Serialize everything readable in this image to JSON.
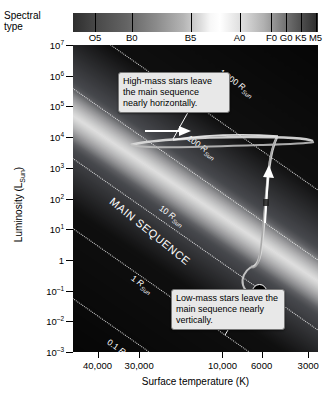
{
  "chart_data": {
    "type": "scatter",
    "xlabel": "Surface temperature (K)",
    "ylabel": "Luminosity (L_Sun)",
    "xlim": [
      40000,
      3000
    ],
    "ylim": [
      0.001,
      10000000
    ],
    "xscale": "log-reversed",
    "yscale": "log",
    "grid": false,
    "legend": "none",
    "x_ticks": [
      "40,000",
      "30,000",
      "10,000",
      "6000",
      "3000"
    ],
    "x_tick_values": [
      40000,
      30000,
      10000,
      6000,
      3000
    ],
    "y_ticks": [
      "10^7",
      "10^6",
      "10^5",
      "10^4",
      "10^3",
      "10^2",
      "10^1",
      "1",
      "10^-1",
      "10^-2",
      "10^-3"
    ],
    "y_tick_values": [
      10000000,
      1000000,
      100000,
      10000,
      1000,
      100,
      10,
      1,
      0.1,
      0.01,
      0.001
    ],
    "spectral_classes": [
      "O5",
      "B0",
      "B5",
      "A0",
      "F0",
      "G0",
      "K5",
      "M5"
    ],
    "spectral_axis_label": "Spectral type",
    "radius_lines": [
      {
        "label": "1,000",
        "unit": "R",
        "sub": "Sun"
      },
      {
        "label": "100",
        "unit": "R",
        "sub": "Sun"
      },
      {
        "label": "10",
        "unit": "R",
        "sub": "Sun"
      },
      {
        "label": "1",
        "unit": "R",
        "sub": "Sun"
      },
      {
        "label": "0.1",
        "unit": "R",
        "sub": "Sun"
      },
      {
        "label": "0.01",
        "unit": "R",
        "sub": "Sun"
      },
      {
        "label": "0.001",
        "unit": "R",
        "sub": "Sun"
      }
    ],
    "band_label": "MAIN SEQUENCE",
    "annotations": [
      {
        "text": "High-mass stars leave the main sequence nearly horizontally.",
        "track": "high-mass"
      },
      {
        "text": "Low-mass stars leave the main sequence nearly vertically.",
        "track": "low-mass"
      }
    ],
    "markers": [
      {
        "name": "sun-symbol",
        "symbol": "☉",
        "temperature": 5800,
        "luminosity": 1
      }
    ]
  },
  "axes": {
    "spectral": {
      "label_line1": "Spectral",
      "label_line2": "type",
      "classes": [
        {
          "name": "O5",
          "pos": 9
        },
        {
          "name": "B0",
          "pos": 24
        },
        {
          "name": "B5",
          "pos": 48
        },
        {
          "name": "A0",
          "pos": 68
        },
        {
          "name": "F0",
          "pos": 81
        },
        {
          "name": "G0",
          "pos": 87
        },
        {
          "name": "K5",
          "pos": 93
        },
        {
          "name": "M5",
          "pos": 99
        }
      ]
    },
    "y": {
      "title_main": "Luminosity (L",
      "title_sub": "Sun",
      "title_end": ")",
      "ticks": [
        {
          "mant": "10",
          "exp": "7"
        },
        {
          "mant": "10",
          "exp": "6"
        },
        {
          "mant": "10",
          "exp": "5"
        },
        {
          "mant": "10",
          "exp": "4"
        },
        {
          "mant": "10",
          "exp": "3"
        },
        {
          "mant": "10",
          "exp": "2"
        },
        {
          "mant": "10",
          "exp": "1"
        },
        {
          "mant": "1",
          "exp": ""
        },
        {
          "mant": "10",
          "exp": "–1"
        },
        {
          "mant": "10",
          "exp": "–2"
        },
        {
          "mant": "10",
          "exp": "–3"
        }
      ]
    },
    "x": {
      "title": "Surface temperature (K)",
      "ticks": [
        {
          "label": "40,000",
          "pos": 10
        },
        {
          "label": "30,000",
          "pos": 27
        },
        {
          "label": "10,000",
          "pos": 61
        },
        {
          "label": "6000",
          "pos": 77
        },
        {
          "label": "3000",
          "pos": 96
        }
      ]
    }
  },
  "plot": {
    "main_sequence_label": "MAIN SEQUENCE",
    "radius_labels": [
      {
        "value": "1,000",
        "r": "R",
        "sub": "Sun"
      },
      {
        "value": "100",
        "r": "R",
        "sub": "Sun"
      },
      {
        "value": "10",
        "r": "R",
        "sub": "Sun"
      },
      {
        "value": "1",
        "r": "R",
        "sub": "Sun"
      },
      {
        "value": "0.1",
        "r": "R",
        "sub": "Sun"
      },
      {
        "value": "0.01",
        "r": "R",
        "sub": "Sun"
      },
      {
        "value": "0.001",
        "r": "R",
        "sub": "Sun"
      }
    ],
    "callout_high": "High-mass stars leave the main sequence nearly horizontally.",
    "callout_low": "Low-mass stars leave the main sequence nearly vertically.",
    "sun_symbol": "☉"
  },
  "colors": {
    "plot_background": "#000000",
    "callout_background": "#e8e8e8",
    "track_color": "#d8d8d8",
    "radius_line_color": "#ffffff",
    "page_background": "#ffffff"
  }
}
